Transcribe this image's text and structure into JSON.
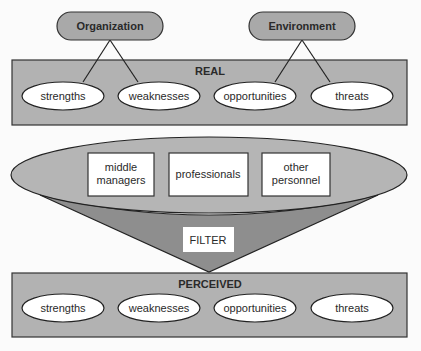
{
  "colors": {
    "background": "#fbfbfb",
    "box_fill": "#b2b2b2",
    "pill_fill": "#a9a9a9",
    "lens_fill": "#b5b5b5",
    "cone_fill": "#8e8e8e",
    "stroke": "#333333",
    "white": "#ffffff"
  },
  "sources": {
    "organization": "Organization",
    "environment": "Environment"
  },
  "real": {
    "title": "REAL",
    "items": [
      "strengths",
      "weaknesses",
      "opportunities",
      "threats"
    ]
  },
  "filter": {
    "groups": [
      {
        "line1": "middle",
        "line2": "managers"
      },
      {
        "line1": "professionals",
        "line2": ""
      },
      {
        "line1": "other",
        "line2": "personnel"
      }
    ],
    "label": "FILTER"
  },
  "perceived": {
    "title": "PERCEIVED",
    "items": [
      "strengths",
      "weaknesses",
      "opportunities",
      "threats"
    ]
  }
}
